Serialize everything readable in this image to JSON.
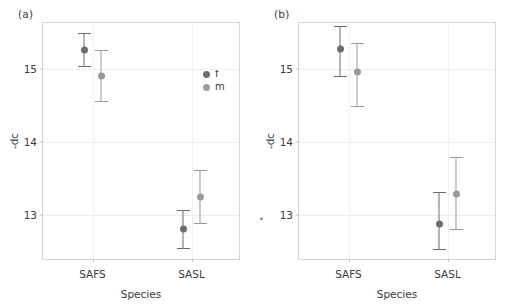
{
  "figure": {
    "panels": [
      {
        "label": "(a)",
        "xlabel": "Species",
        "ylabel": "-dc"
      },
      {
        "label": "(b)",
        "xlabel": "Species",
        "ylabel": "-dc"
      }
    ],
    "legend": {
      "position": "inside-right-upper",
      "entries": [
        {
          "key": "f",
          "label": "f",
          "color": "#6d6d6d"
        },
        {
          "key": "m",
          "label": "m",
          "color": "#9a9a9a"
        }
      ]
    },
    "colors": {
      "female": "#6d6d6d",
      "male": "#9a9a9a",
      "frame": "#d6d6d6",
      "grid": "#ededed",
      "text": "#3a3a3a"
    }
  },
  "chart_data": [
    {
      "type": "scatter",
      "panel": "(a)",
      "title": "",
      "xlabel": "Species",
      "ylabel": "-dc",
      "categories": [
        "SAFS",
        "SASL"
      ],
      "yticks": [
        13,
        14,
        15
      ],
      "ytick_labels": [
        "13",
        "14",
        "15"
      ],
      "ylim": [
        12.38,
        15.62
      ],
      "grid": true,
      "legend": [
        "f",
        "m"
      ],
      "series": [
        {
          "name": "f",
          "color": "#6d6d6d",
          "values": [
            15.25,
            12.82
          ],
          "ci_low": [
            15.02,
            12.55
          ],
          "ci_high": [
            15.49,
            13.08
          ]
        },
        {
          "name": "m",
          "color": "#9a9a9a",
          "values": [
            14.9,
            13.25
          ],
          "ci_low": [
            14.54,
            12.89
          ],
          "ci_high": [
            15.25,
            13.62
          ]
        }
      ]
    },
    {
      "type": "scatter",
      "panel": "(b)",
      "title": "",
      "xlabel": "Species",
      "ylabel": "-dc",
      "categories": [
        "SAFS",
        "SASL"
      ],
      "yticks": [
        13,
        14,
        15
      ],
      "ytick_labels": [
        "13",
        "14",
        "15"
      ],
      "ylim": [
        12.38,
        15.62
      ],
      "grid": true,
      "legend": [
        "f",
        "m"
      ],
      "series": [
        {
          "name": "f",
          "color": "#6d6d6d",
          "values": [
            15.27,
            12.88
          ],
          "ci_low": [
            14.89,
            12.53
          ],
          "ci_high": [
            15.58,
            13.32
          ]
        },
        {
          "name": "m",
          "color": "#9a9a9a",
          "values": [
            14.95,
            13.29
          ],
          "ci_low": [
            14.47,
            12.8
          ],
          "ci_high": [
            15.35,
            13.8
          ]
        }
      ]
    }
  ]
}
